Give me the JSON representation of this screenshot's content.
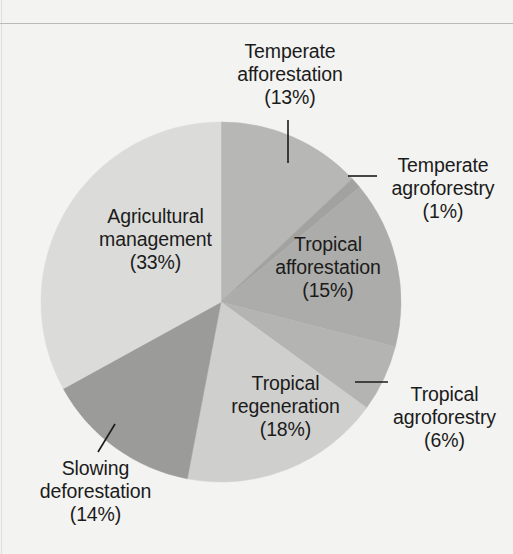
{
  "figure": {
    "background_color": "#f3f3f1",
    "rule_color": "#b9b9b7"
  },
  "chart_data": {
    "type": "pie",
    "title": "",
    "xlabel": "",
    "ylabel": "",
    "legend_position": "none",
    "grid": false,
    "units": "percent",
    "total": 100,
    "categories": [
      "Temperate afforestation",
      "Temperate agroforestry",
      "Tropical afforestation",
      "Tropical agroforestry",
      "Tropical regeneration",
      "Slowing deforestation",
      "Agricultural management"
    ],
    "values": [
      13,
      1,
      15,
      6,
      18,
      14,
      33
    ],
    "colors": [
      "#b7b7b5",
      "#a2a2a0",
      "#acacaa",
      "#b4b4b2",
      "#cfcfcd",
      "#9b9b99",
      "#dbdbd9"
    ],
    "slices": [
      {
        "label": "Temperate afforestation",
        "value": 13,
        "percent_text": "(13%)",
        "color": "#b7b7b5",
        "label_lines": [
          "Temperate",
          "afforestation"
        ],
        "has_leader_line": true
      },
      {
        "label": "Temperate agroforestry",
        "value": 1,
        "percent_text": "(1%)",
        "color": "#a2a2a0",
        "label_lines": [
          "Temperate",
          "agroforestry"
        ],
        "has_leader_line": true
      },
      {
        "label": "Tropical afforestation",
        "value": 15,
        "percent_text": "(15%)",
        "color": "#acacaa",
        "label_lines": [
          "Tropical",
          "afforestation"
        ],
        "has_leader_line": false
      },
      {
        "label": "Tropical agroforestry",
        "value": 6,
        "percent_text": "(6%)",
        "color": "#b4b4b2",
        "label_lines": [
          "Tropical",
          "agroforestry"
        ],
        "has_leader_line": true
      },
      {
        "label": "Tropical regeneration",
        "value": 18,
        "percent_text": "(18%)",
        "color": "#cfcfcd",
        "label_lines": [
          "Tropical",
          "regeneration"
        ],
        "has_leader_line": false
      },
      {
        "label": "Slowing deforestation",
        "value": 14,
        "percent_text": "(14%)",
        "color": "#9b9b99",
        "label_lines": [
          "Slowing",
          "deforestation"
        ],
        "has_leader_line": true
      },
      {
        "label": "Agricultural management",
        "value": 33,
        "percent_text": "(33%)",
        "color": "#dbdbd9",
        "label_lines": [
          "Agricultural",
          "management"
        ],
        "has_leader_line": false
      }
    ]
  },
  "labels": {
    "temperate_afforestation": "Temperate\nafforestation\n(13%)",
    "temperate_agroforestry": "Temperate\nagroforestry\n(1%)",
    "tropical_afforestation": "Tropical\nafforestation\n(15%)",
    "tropical_agroforestry": "Tropical\nagroforestry\n(6%)",
    "tropical_regeneration": "Tropical\nregeneration\n(18%)",
    "slowing_deforestation": "Slowing\ndeforestation\n(14%)",
    "agricultural_management": "Agricultural\nmanagement\n(33%)"
  }
}
